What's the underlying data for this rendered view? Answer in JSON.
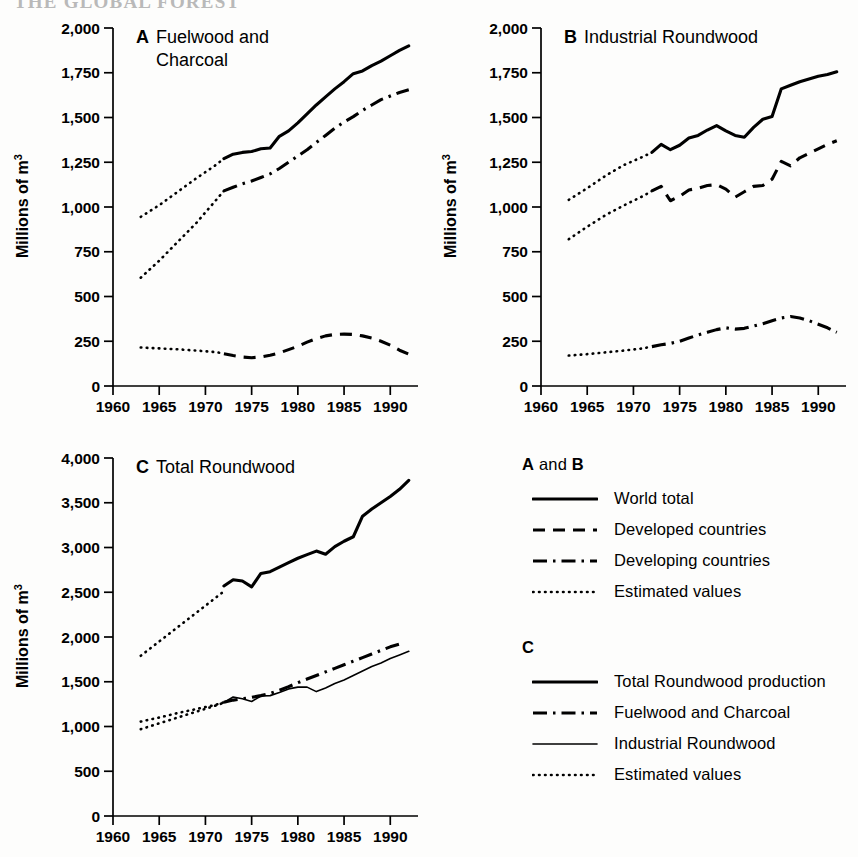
{
  "running_head": "THE GLOBAL FOREST",
  "axis": {
    "y_label": "Millions of m",
    "y_label_sup": "3",
    "x_ticks_ab": [
      "1960",
      "1965",
      "1970",
      "1975",
      "1980",
      "1985",
      "1990"
    ],
    "y_ticks_ab": [
      "0",
      "250",
      "500",
      "750",
      "1,000",
      "1,250",
      "1,500",
      "1,750",
      "2,000"
    ],
    "y_ticks_c": [
      "0",
      "500",
      "1,000",
      "1,500",
      "2,000",
      "2,500",
      "3,000",
      "3,500",
      "4,000"
    ]
  },
  "panels": {
    "a": {
      "letter": "A",
      "title_line1": "Fuelwood and",
      "title_line2": "Charcoal"
    },
    "b": {
      "letter": "B",
      "title_line1": "Industrial Roundwood",
      "title_line2": ""
    },
    "c": {
      "letter": "C",
      "title_line1": "Total Roundwood",
      "title_line2": ""
    }
  },
  "legend": {
    "group_ab": {
      "title_a": "A",
      "title_and": " and ",
      "title_b": "B",
      "items": [
        {
          "label": "World total",
          "style": "solid"
        },
        {
          "label": "Developed countries",
          "style": "dashed"
        },
        {
          "label": "Developing countries",
          "style": "dashdot"
        },
        {
          "label": "Estimated values",
          "style": "dotted"
        }
      ]
    },
    "group_c": {
      "title": "C",
      "items": [
        {
          "label": "Total Roundwood production",
          "style": "solid"
        },
        {
          "label": "Fuelwood and Charcoal",
          "style": "dashdot"
        },
        {
          "label": "Industrial Roundwood",
          "style": "thin"
        },
        {
          "label": "Estimated values",
          "style": "dotted"
        }
      ]
    }
  },
  "chart_data": [
    {
      "id": "panel_a",
      "type": "line",
      "title": "A  Fuelwood and Charcoal",
      "xlabel": "",
      "ylabel": "Millions of m3",
      "xlim": [
        1960,
        1993
      ],
      "ylim": [
        0,
        2000
      ],
      "ytick_step": 250,
      "xtick_step": 5,
      "grid": false,
      "legend_position": "external-right",
      "series": [
        {
          "name": "World total",
          "style": "solid",
          "x": [
            1972,
            1973,
            1974,
            1975,
            1976,
            1977,
            1978,
            1979,
            1980,
            1981,
            1982,
            1983,
            1984,
            1985,
            1986,
            1987,
            1988,
            1989,
            1990,
            1991,
            1992
          ],
          "values": [
            1270,
            1295,
            1305,
            1310,
            1325,
            1330,
            1395,
            1425,
            1470,
            1520,
            1570,
            1615,
            1660,
            1700,
            1745,
            1760,
            1790,
            1815,
            1845,
            1875,
            1900
          ]
        },
        {
          "name": "World total (estimated)",
          "style": "dotted",
          "x": [
            1963,
            1965,
            1967,
            1969,
            1971,
            1972
          ],
          "values": [
            945,
            1010,
            1085,
            1160,
            1230,
            1270
          ]
        },
        {
          "name": "Developing countries",
          "style": "dashdot",
          "x": [
            1972,
            1973,
            1974,
            1975,
            1976,
            1977,
            1978,
            1979,
            1980,
            1981,
            1982,
            1983,
            1984,
            1985,
            1986,
            1987,
            1988,
            1989,
            1990,
            1991,
            1992
          ],
          "values": [
            1090,
            1110,
            1130,
            1145,
            1165,
            1185,
            1215,
            1250,
            1285,
            1320,
            1360,
            1400,
            1440,
            1475,
            1505,
            1540,
            1570,
            1600,
            1620,
            1640,
            1655
          ]
        },
        {
          "name": "Developing countries (estimated)",
          "style": "dotted",
          "x": [
            1963,
            1965,
            1967,
            1969,
            1971,
            1972
          ],
          "values": [
            605,
            700,
            805,
            910,
            1030,
            1090
          ]
        },
        {
          "name": "Developed countries",
          "style": "dashed",
          "x": [
            1972,
            1973,
            1974,
            1975,
            1976,
            1977,
            1978,
            1979,
            1980,
            1981,
            1982,
            1983,
            1984,
            1985,
            1986,
            1987,
            1988,
            1989,
            1990,
            1991,
            1992
          ],
          "values": [
            180,
            170,
            162,
            158,
            162,
            172,
            185,
            203,
            222,
            245,
            265,
            280,
            288,
            290,
            288,
            280,
            268,
            250,
            228,
            200,
            178
          ]
        },
        {
          "name": "Developed countries (estimated)",
          "style": "dotted",
          "x": [
            1963,
            1965,
            1967,
            1969,
            1971,
            1972
          ],
          "values": [
            215,
            210,
            205,
            198,
            190,
            182
          ]
        }
      ]
    },
    {
      "id": "panel_b",
      "type": "line",
      "title": "B  Industrial Roundwood",
      "xlabel": "",
      "ylabel": "Millions of m3",
      "xlim": [
        1960,
        1993
      ],
      "ylim": [
        0,
        2000
      ],
      "ytick_step": 250,
      "xtick_step": 5,
      "grid": false,
      "legend_position": "external-right",
      "series": [
        {
          "name": "World total",
          "style": "solid",
          "x": [
            1972,
            1973,
            1974,
            1975,
            1976,
            1977,
            1978,
            1979,
            1980,
            1981,
            1982,
            1983,
            1984,
            1985,
            1986,
            1987,
            1988,
            1989,
            1990,
            1991,
            1992
          ],
          "values": [
            1305,
            1350,
            1320,
            1345,
            1385,
            1400,
            1430,
            1455,
            1425,
            1400,
            1390,
            1445,
            1490,
            1505,
            1660,
            1680,
            1700,
            1715,
            1730,
            1740,
            1755
          ]
        },
        {
          "name": "World total (estimated)",
          "style": "dotted",
          "x": [
            1963,
            1965,
            1967,
            1969,
            1971,
            1972
          ],
          "values": [
            1040,
            1105,
            1175,
            1235,
            1280,
            1305
          ]
        },
        {
          "name": "Developed countries",
          "style": "dashed",
          "x": [
            1972,
            1973,
            1974,
            1975,
            1976,
            1977,
            1978,
            1979,
            1980,
            1981,
            1982,
            1983,
            1984,
            1985,
            1986,
            1987,
            1988,
            1989,
            1990,
            1991,
            1992
          ],
          "values": [
            1090,
            1115,
            1035,
            1060,
            1095,
            1105,
            1120,
            1125,
            1100,
            1055,
            1085,
            1115,
            1120,
            1155,
            1255,
            1230,
            1275,
            1300,
            1325,
            1350,
            1370
          ]
        },
        {
          "name": "Developed countries (estimated)",
          "style": "dotted",
          "x": [
            1963,
            1965,
            1967,
            1969,
            1971,
            1972
          ],
          "values": [
            820,
            890,
            955,
            1010,
            1060,
            1090
          ]
        },
        {
          "name": "Developing countries",
          "style": "dashdot",
          "x": [
            1972,
            1973,
            1974,
            1975,
            1976,
            1977,
            1978,
            1979,
            1980,
            1981,
            1982,
            1983,
            1984,
            1985,
            1986,
            1987,
            1988,
            1989,
            1990,
            1991,
            1992
          ],
          "values": [
            220,
            230,
            238,
            250,
            268,
            285,
            300,
            315,
            325,
            318,
            322,
            335,
            348,
            365,
            380,
            388,
            380,
            365,
            345,
            325,
            300
          ]
        },
        {
          "name": "Developing countries (estimated)",
          "style": "dotted",
          "x": [
            1963,
            1965,
            1967,
            1969,
            1971,
            1972
          ],
          "values": [
            170,
            178,
            188,
            198,
            210,
            220
          ]
        }
      ]
    },
    {
      "id": "panel_c",
      "type": "line",
      "title": "C  Total Roundwood",
      "xlabel": "",
      "ylabel": "Millions of m3",
      "xlim": [
        1960,
        1993
      ],
      "ylim": [
        0,
        4000
      ],
      "ytick_step": 500,
      "xtick_step": 5,
      "grid": false,
      "legend_position": "external-right",
      "series": [
        {
          "name": "Total Roundwood production",
          "style": "solid",
          "x": [
            1972,
            1973,
            1974,
            1975,
            1976,
            1977,
            1978,
            1979,
            1980,
            1981,
            1982,
            1983,
            1984,
            1985,
            1986,
            1987,
            1988,
            1989,
            1990,
            1991,
            1992
          ],
          "values": [
            2570,
            2640,
            2625,
            2560,
            2710,
            2730,
            2780,
            2830,
            2880,
            2920,
            2960,
            2925,
            3010,
            3070,
            3120,
            3350,
            3430,
            3500,
            3570,
            3650,
            3750
          ]
        },
        {
          "name": "Total Roundwood production (estimated)",
          "style": "dotted",
          "x": [
            1963,
            1965,
            1967,
            1969,
            1971,
            1972
          ],
          "values": [
            1790,
            1950,
            2110,
            2270,
            2430,
            2510
          ]
        },
        {
          "name": "Fuelwood and Charcoal",
          "style": "dashdot",
          "x": [
            1972,
            1973,
            1974,
            1975,
            1976,
            1977,
            1978,
            1979,
            1980,
            1981,
            1982,
            1983,
            1984,
            1985,
            1986,
            1987,
            1988,
            1989,
            1990,
            1991
          ],
          "values": [
            1270,
            1295,
            1310,
            1325,
            1345,
            1370,
            1405,
            1445,
            1490,
            1530,
            1570,
            1610,
            1650,
            1690,
            1730,
            1770,
            1810,
            1850,
            1890,
            1920
          ]
        },
        {
          "name": "Fuelwood and Charcoal (estimated)",
          "style": "dotted",
          "x": [
            1963,
            1965,
            1967,
            1969,
            1971,
            1972
          ],
          "values": [
            1055,
            1100,
            1150,
            1195,
            1240,
            1270
          ]
        },
        {
          "name": "Industrial Roundwood",
          "style": "thin",
          "x": [
            1972,
            1973,
            1974,
            1975,
            1976,
            1977,
            1978,
            1979,
            1980,
            1981,
            1982,
            1983,
            1984,
            1985,
            1986,
            1987,
            1988,
            1989,
            1990,
            1991,
            1992
          ],
          "values": [
            1270,
            1330,
            1310,
            1280,
            1340,
            1345,
            1380,
            1420,
            1440,
            1440,
            1390,
            1430,
            1480,
            1520,
            1570,
            1620,
            1670,
            1710,
            1760,
            1800,
            1840
          ]
        },
        {
          "name": "Industrial Roundwood (estimated)",
          "style": "dotted",
          "x": [
            1963,
            1965,
            1967,
            1969,
            1971,
            1972
          ],
          "values": [
            970,
            1035,
            1100,
            1165,
            1230,
            1265
          ]
        }
      ]
    }
  ]
}
